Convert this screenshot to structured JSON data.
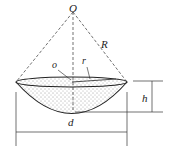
{
  "diagram": {
    "labels": {
      "apex": "O",
      "sphere_radius": "R",
      "base_center": "o",
      "base_radius": "r",
      "height": "h",
      "diameter": "d"
    },
    "colors": {
      "stroke": "#222222",
      "fill": "#ffffff",
      "stipple": "#333333"
    }
  }
}
